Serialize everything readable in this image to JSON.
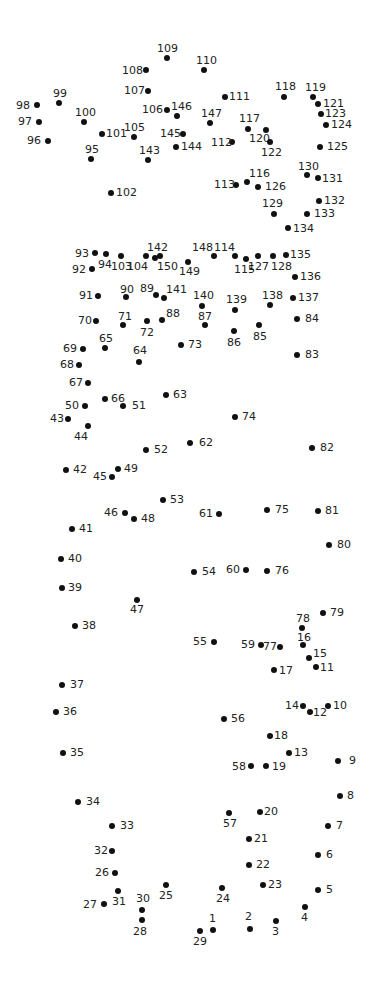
{
  "puzzle": {
    "title": "Connect the dots",
    "dot_color": "#111111",
    "label_color": "#222222",
    "points": [
      {
        "n": 1,
        "x": 213,
        "y": 930,
        "lx": 209,
        "ly": 913
      },
      {
        "n": 2,
        "x": 250,
        "y": 929,
        "lx": 245,
        "ly": 911
      },
      {
        "n": 3,
        "x": 276,
        "y": 921,
        "lx": 272,
        "ly": 926
      },
      {
        "n": 4,
        "x": 305,
        "y": 907,
        "lx": 301,
        "ly": 912
      },
      {
        "n": 5,
        "x": 318,
        "y": 890,
        "lx": 326,
        "ly": 884
      },
      {
        "n": 6,
        "x": 318,
        "y": 855,
        "lx": 326,
        "ly": 849
      },
      {
        "n": 7,
        "x": 328,
        "y": 826,
        "lx": 336,
        "ly": 820
      },
      {
        "n": 8,
        "x": 340,
        "y": 796,
        "lx": 347,
        "ly": 790
      },
      {
        "n": 9,
        "x": 338,
        "y": 761,
        "lx": 349,
        "ly": 755
      },
      {
        "n": 10,
        "x": 328,
        "y": 706,
        "lx": 333,
        "ly": 700
      },
      {
        "n": 11,
        "x": 316,
        "y": 667,
        "lx": 320,
        "ly": 662
      },
      {
        "n": 12,
        "x": 310,
        "y": 712,
        "lx": 313,
        "ly": 707
      },
      {
        "n": 13,
        "x": 289,
        "y": 753,
        "lx": 294,
        "ly": 747
      },
      {
        "n": 14,
        "x": 303,
        "y": 706,
        "lx": 285,
        "ly": 700
      },
      {
        "n": 15,
        "x": 309,
        "y": 658,
        "lx": 313,
        "ly": 648
      },
      {
        "n": 16,
        "x": 303,
        "y": 645,
        "lx": 297,
        "ly": 632
      },
      {
        "n": 17,
        "x": 274,
        "y": 670,
        "lx": 279,
        "ly": 665
      },
      {
        "n": 18,
        "x": 270,
        "y": 736,
        "lx": 274,
        "ly": 730
      },
      {
        "n": 19,
        "x": 266,
        "y": 766,
        "lx": 272,
        "ly": 761
      },
      {
        "n": 20,
        "x": 260,
        "y": 812,
        "lx": 264,
        "ly": 806
      },
      {
        "n": 21,
        "x": 249,
        "y": 839,
        "lx": 254,
        "ly": 833
      },
      {
        "n": 22,
        "x": 249,
        "y": 865,
        "lx": 256,
        "ly": 859
      },
      {
        "n": 23,
        "x": 263,
        "y": 885,
        "lx": 268,
        "ly": 879
      },
      {
        "n": 24,
        "x": 222,
        "y": 888,
        "lx": 216,
        "ly": 893
      },
      {
        "n": 25,
        "x": 166,
        "y": 885,
        "lx": 159,
        "ly": 890
      },
      {
        "n": 26,
        "x": 115,
        "y": 873,
        "lx": 95,
        "ly": 867
      },
      {
        "n": 27,
        "x": 104,
        "y": 904,
        "lx": 83,
        "ly": 899
      },
      {
        "n": 28,
        "x": 142,
        "y": 920,
        "lx": 133,
        "ly": 926
      },
      {
        "n": 29,
        "x": 200,
        "y": 931,
        "lx": 193,
        "ly": 936
      },
      {
        "n": 30,
        "x": 142,
        "y": 910,
        "lx": 136,
        "ly": 893
      },
      {
        "n": 31,
        "x": 118,
        "y": 891,
        "lx": 112,
        "ly": 896
      },
      {
        "n": 32,
        "x": 112,
        "y": 851,
        "lx": 94,
        "ly": 845
      },
      {
        "n": 33,
        "x": 112,
        "y": 826,
        "lx": 120,
        "ly": 820
      },
      {
        "n": 34,
        "x": 78,
        "y": 802,
        "lx": 86,
        "ly": 796
      },
      {
        "n": 35,
        "x": 63,
        "y": 753,
        "lx": 70,
        "ly": 747
      },
      {
        "n": 36,
        "x": 56,
        "y": 712,
        "lx": 63,
        "ly": 706
      },
      {
        "n": 37,
        "x": 62,
        "y": 685,
        "lx": 70,
        "ly": 679
      },
      {
        "n": 38,
        "x": 75,
        "y": 626,
        "lx": 82,
        "ly": 620
      },
      {
        "n": 39,
        "x": 62,
        "y": 588,
        "lx": 68,
        "ly": 582
      },
      {
        "n": 40,
        "x": 61,
        "y": 559,
        "lx": 68,
        "ly": 553
      },
      {
        "n": 41,
        "x": 72,
        "y": 529,
        "lx": 79,
        "ly": 523
      },
      {
        "n": 42,
        "x": 66,
        "y": 470,
        "lx": 73,
        "ly": 464
      },
      {
        "n": 43,
        "x": 68,
        "y": 419,
        "lx": 50,
        "ly": 413
      },
      {
        "n": 44,
        "x": 88,
        "y": 426,
        "lx": 74,
        "ly": 431
      },
      {
        "n": 45,
        "x": 112,
        "y": 477,
        "lx": 93,
        "ly": 471
      },
      {
        "n": 46,
        "x": 125,
        "y": 513,
        "lx": 104,
        "ly": 507
      },
      {
        "n": 47,
        "x": 137,
        "y": 600,
        "lx": 130,
        "ly": 604
      },
      {
        "n": 48,
        "x": 134,
        "y": 519,
        "lx": 141,
        "ly": 513
      },
      {
        "n": 49,
        "x": 118,
        "y": 469,
        "lx": 124,
        "ly": 463
      },
      {
        "n": 50,
        "x": 85,
        "y": 406,
        "lx": 65,
        "ly": 400
      },
      {
        "n": 51,
        "x": 123,
        "y": 406,
        "lx": 132,
        "ly": 400
      },
      {
        "n": 52,
        "x": 146,
        "y": 450,
        "lx": 154,
        "ly": 444
      },
      {
        "n": 53,
        "x": 163,
        "y": 500,
        "lx": 170,
        "ly": 494
      },
      {
        "n": 54,
        "x": 194,
        "y": 572,
        "lx": 202,
        "ly": 566
      },
      {
        "n": 55,
        "x": 214,
        "y": 642,
        "lx": 193,
        "ly": 636
      },
      {
        "n": 56,
        "x": 224,
        "y": 719,
        "lx": 231,
        "ly": 713
      },
      {
        "n": 57,
        "x": 229,
        "y": 813,
        "lx": 223,
        "ly": 818
      },
      {
        "n": 58,
        "x": 251,
        "y": 766,
        "lx": 232,
        "ly": 761
      },
      {
        "n": 59,
        "x": 261,
        "y": 645,
        "lx": 241,
        "ly": 639
      },
      {
        "n": 60,
        "x": 246,
        "y": 570,
        "lx": 226,
        "ly": 564
      },
      {
        "n": 61,
        "x": 219,
        "y": 514,
        "lx": 199,
        "ly": 508
      },
      {
        "n": 62,
        "x": 190,
        "y": 443,
        "lx": 199,
        "ly": 437
      },
      {
        "n": 63,
        "x": 166,
        "y": 395,
        "lx": 173,
        "ly": 389
      },
      {
        "n": 64,
        "x": 139,
        "y": 362,
        "lx": 133,
        "ly": 345
      },
      {
        "n": 65,
        "x": 105,
        "y": 348,
        "lx": 99,
        "ly": 333
      },
      {
        "n": 66,
        "x": 105,
        "y": 399,
        "lx": 111,
        "ly": 393
      },
      {
        "n": 67,
        "x": 88,
        "y": 383,
        "lx": 69,
        "ly": 377
      },
      {
        "n": 68,
        "x": 79,
        "y": 365,
        "lx": 60,
        "ly": 359
      },
      {
        "n": 69,
        "x": 83,
        "y": 349,
        "lx": 63,
        "ly": 343
      },
      {
        "n": 70,
        "x": 96,
        "y": 321,
        "lx": 78,
        "ly": 315
      },
      {
        "n": 71,
        "x": 123,
        "y": 325,
        "lx": 118,
        "ly": 311
      },
      {
        "n": 72,
        "x": 147,
        "y": 321,
        "lx": 140,
        "ly": 327
      },
      {
        "n": 73,
        "x": 181,
        "y": 345,
        "lx": 188,
        "ly": 339
      },
      {
        "n": 74,
        "x": 235,
        "y": 417,
        "lx": 242,
        "ly": 411
      },
      {
        "n": 75,
        "x": 267,
        "y": 510,
        "lx": 275,
        "ly": 504
      },
      {
        "n": 76,
        "x": 267,
        "y": 571,
        "lx": 275,
        "ly": 565
      },
      {
        "n": 77,
        "x": 280,
        "y": 647,
        "lx": 263,
        "ly": 641
      },
      {
        "n": 78,
        "x": 302,
        "y": 628,
        "lx": 296,
        "ly": 613
      },
      {
        "n": 79,
        "x": 323,
        "y": 613,
        "lx": 330,
        "ly": 607
      },
      {
        "n": 80,
        "x": 329,
        "y": 545,
        "lx": 337,
        "ly": 539
      },
      {
        "n": 81,
        "x": 318,
        "y": 511,
        "lx": 325,
        "ly": 505
      },
      {
        "n": 82,
        "x": 312,
        "y": 448,
        "lx": 320,
        "ly": 442
      },
      {
        "n": 83,
        "x": 297,
        "y": 355,
        "lx": 305,
        "ly": 349
      },
      {
        "n": 84,
        "x": 297,
        "y": 319,
        "lx": 305,
        "ly": 313
      },
      {
        "n": 85,
        "x": 259,
        "y": 325,
        "lx": 253,
        "ly": 331
      },
      {
        "n": 86,
        "x": 234,
        "y": 331,
        "lx": 227,
        "ly": 337
      },
      {
        "n": 87,
        "x": 205,
        "y": 325,
        "lx": 198,
        "ly": 311
      },
      {
        "n": 88,
        "x": 162,
        "y": 320,
        "lx": 166,
        "ly": 308
      },
      {
        "n": 89,
        "x": 156,
        "y": 295,
        "lx": 140,
        "ly": 283
      },
      {
        "n": 90,
        "x": 126,
        "y": 297,
        "lx": 120,
        "ly": 284
      },
      {
        "n": 91,
        "x": 98,
        "y": 296,
        "lx": 79,
        "ly": 290
      },
      {
        "n": 92,
        "x": 92,
        "y": 269,
        "lx": 72,
        "ly": 264
      },
      {
        "n": 93,
        "x": 95,
        "y": 253,
        "lx": 75,
        "ly": 248
      },
      {
        "n": 94,
        "x": 106,
        "y": 254,
        "lx": 98,
        "ly": 259
      },
      {
        "n": 95,
        "x": 91,
        "y": 159,
        "lx": 85,
        "ly": 144
      },
      {
        "n": 96,
        "x": 48,
        "y": 141,
        "lx": 27,
        "ly": 135
      },
      {
        "n": 97,
        "x": 39,
        "y": 122,
        "lx": 18,
        "ly": 116
      },
      {
        "n": 98,
        "x": 37,
        "y": 105,
        "lx": 16,
        "ly": 100
      },
      {
        "n": 99,
        "x": 59,
        "y": 103,
        "lx": 53,
        "ly": 88
      },
      {
        "n": 100,
        "x": 84,
        "y": 122,
        "lx": 75,
        "ly": 107
      },
      {
        "n": 101,
        "x": 102,
        "y": 134,
        "lx": 106,
        "ly": 128
      },
      {
        "n": 102,
        "x": 111,
        "y": 193,
        "lx": 116,
        "ly": 187
      },
      {
        "n": 103,
        "x": 121,
        "y": 256,
        "lx": 111,
        "ly": 261
      },
      {
        "n": 104,
        "x": 146,
        "y": 256,
        "lx": 127,
        "ly": 261
      },
      {
        "n": 105,
        "x": 134,
        "y": 137,
        "lx": 124,
        "ly": 122
      },
      {
        "n": 106,
        "x": 167,
        "y": 110,
        "lx": 142,
        "ly": 104
      },
      {
        "n": 107,
        "x": 148,
        "y": 91,
        "lx": 124,
        "ly": 85
      },
      {
        "n": 108,
        "x": 146,
        "y": 70,
        "lx": 122,
        "ly": 65
      },
      {
        "n": 109,
        "x": 167,
        "y": 58,
        "lx": 157,
        "ly": 43
      },
      {
        "n": 110,
        "x": 204,
        "y": 70,
        "lx": 196,
        "ly": 55
      },
      {
        "n": 111,
        "x": 225,
        "y": 97,
        "lx": 229,
        "ly": 91
      },
      {
        "n": 112,
        "x": 232,
        "y": 142,
        "lx": 211,
        "ly": 137
      },
      {
        "n": 113,
        "x": 236,
        "y": 185,
        "lx": 214,
        "ly": 179
      },
      {
        "n": 114,
        "x": 235,
        "y": 256,
        "lx": 214,
        "ly": 242
      },
      {
        "n": 115,
        "x": 246,
        "y": 259,
        "lx": 234,
        "ly": 264
      },
      {
        "n": 116,
        "x": 247,
        "y": 182,
        "lx": 249,
        "ly": 168
      },
      {
        "n": 117,
        "x": 248,
        "y": 129,
        "lx": 239,
        "ly": 113
      },
      {
        "n": 118,
        "x": 284,
        "y": 97,
        "lx": 275,
        "ly": 81
      },
      {
        "n": 119,
        "x": 313,
        "y": 97,
        "lx": 305,
        "ly": 82
      },
      {
        "n": 120,
        "x": 266,
        "y": 130,
        "lx": 249,
        "ly": 133
      },
      {
        "n": 121,
        "x": 318,
        "y": 104,
        "lx": 323,
        "ly": 98
      },
      {
        "n": 122,
        "x": 270,
        "y": 142,
        "lx": 261,
        "ly": 147
      },
      {
        "n": 123,
        "x": 321,
        "y": 114,
        "lx": 325,
        "ly": 108
      },
      {
        "n": 124,
        "x": 326,
        "y": 125,
        "lx": 331,
        "ly": 119
      },
      {
        "n": 125,
        "x": 320,
        "y": 147,
        "lx": 327,
        "ly": 141
      },
      {
        "n": 126,
        "x": 258,
        "y": 187,
        "lx": 265,
        "ly": 181
      },
      {
        "n": 127,
        "x": 258,
        "y": 256,
        "lx": 248,
        "ly": 261
      },
      {
        "n": 128,
        "x": 273,
        "y": 256,
        "lx": 271,
        "ly": 261
      },
      {
        "n": 129,
        "x": 274,
        "y": 214,
        "lx": 262,
        "ly": 198
      },
      {
        "n": 130,
        "x": 307,
        "y": 175,
        "lx": 298,
        "ly": 161
      },
      {
        "n": 131,
        "x": 318,
        "y": 178,
        "lx": 322,
        "ly": 173
      },
      {
        "n": 132,
        "x": 319,
        "y": 201,
        "lx": 324,
        "ly": 195
      },
      {
        "n": 133,
        "x": 307,
        "y": 214,
        "lx": 314,
        "ly": 208
      },
      {
        "n": 134,
        "x": 288,
        "y": 228,
        "lx": 293,
        "ly": 223
      },
      {
        "n": 135,
        "x": 286,
        "y": 255,
        "lx": 290,
        "ly": 249
      },
      {
        "n": 136,
        "x": 295,
        "y": 277,
        "lx": 300,
        "ly": 271
      },
      {
        "n": 137,
        "x": 293,
        "y": 298,
        "lx": 298,
        "ly": 292
      },
      {
        "n": 138,
        "x": 270,
        "y": 305,
        "lx": 262,
        "ly": 290
      },
      {
        "n": 139,
        "x": 235,
        "y": 310,
        "lx": 226,
        "ly": 294
      },
      {
        "n": 140,
        "x": 202,
        "y": 306,
        "lx": 193,
        "ly": 290
      },
      {
        "n": 141,
        "x": 164,
        "y": 298,
        "lx": 166,
        "ly": 284
      },
      {
        "n": 142,
        "x": 160,
        "y": 256,
        "lx": 147,
        "ly": 242
      },
      {
        "n": 143,
        "x": 148,
        "y": 160,
        "lx": 139,
        "ly": 145
      },
      {
        "n": 144,
        "x": 176,
        "y": 147,
        "lx": 181,
        "ly": 141
      },
      {
        "n": 145,
        "x": 183,
        "y": 134,
        "lx": 160,
        "ly": 128
      },
      {
        "n": 146,
        "x": 177,
        "y": 116,
        "lx": 171,
        "ly": 101
      },
      {
        "n": 147,
        "x": 210,
        "y": 123,
        "lx": 201,
        "ly": 108
      },
      {
        "n": 148,
        "x": 214,
        "y": 256,
        "lx": 192,
        "ly": 242
      },
      {
        "n": 149,
        "x": 188,
        "y": 262,
        "lx": 179,
        "ly": 266
      },
      {
        "n": 150,
        "x": 155,
        "y": 258,
        "lx": 157,
        "ly": 261
      }
    ]
  }
}
